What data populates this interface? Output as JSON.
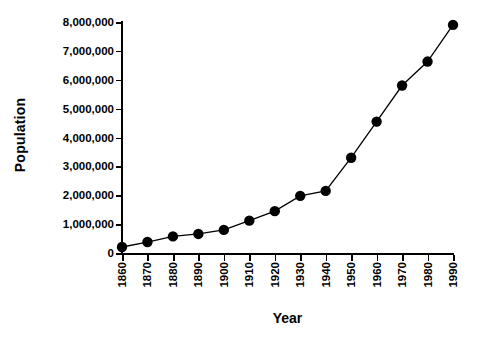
{
  "chart_data": {
    "type": "line",
    "title": "",
    "xlabel": "Year",
    "ylabel": "Population",
    "grid": false,
    "legend": false,
    "marker": "filled-circle",
    "line_color": "#000000",
    "marker_color": "#000000",
    "background": "#ffffff",
    "xlim": [
      1860,
      1990
    ],
    "ylim": [
      0,
      8000000
    ],
    "x_tick_labels": [
      "1860",
      "1870",
      "1880",
      "1890",
      "1900",
      "1910",
      "1920",
      "1930",
      "1940",
      "1950",
      "1960",
      "1970",
      "1980",
      "1990"
    ],
    "y_tick_labels": [
      "0",
      "1,000,000",
      "2,000,000",
      "3,000,000",
      "4,000,000",
      "5,000,000",
      "6,000,000",
      "7,000,000",
      "8,000,000"
    ],
    "y_tick_values": [
      0,
      1000000,
      2000000,
      3000000,
      4000000,
      5000000,
      6000000,
      7000000,
      8000000
    ],
    "categories": [
      1860,
      1870,
      1880,
      1890,
      1900,
      1910,
      1920,
      1930,
      1940,
      1950,
      1960,
      1970,
      1980,
      1990
    ],
    "values": [
      208000,
      380000,
      575000,
      660000,
      800000,
      1120000,
      1450000,
      1980000,
      2150000,
      3300000,
      4550000,
      5800000,
      6630000,
      7900000
    ]
  }
}
